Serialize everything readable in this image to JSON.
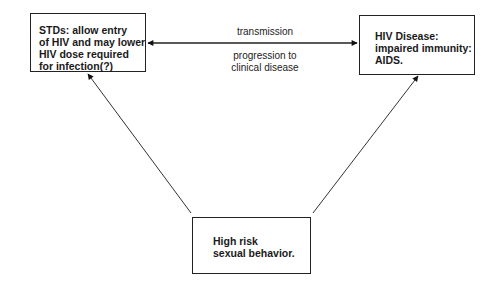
{
  "diagram": {
    "type": "flow-triangle",
    "nodes": {
      "stds": {
        "lines": [
          "STDs: allow entry",
          "of HIV and may lower",
          "HIV dose required",
          "for infection(?)"
        ]
      },
      "hiv_disease": {
        "lines": [
          "HIV Disease:",
          "impaired immunity:",
          "AIDS."
        ]
      },
      "high_risk": {
        "lines": [
          "High risk",
          "sexual behavior."
        ]
      }
    },
    "edges": {
      "horizontal": {
        "from": "stds",
        "to": "hiv_disease",
        "bidirectional": true,
        "label_top": "transmission",
        "label_bottom_lines": [
          "progression to",
          "clinical disease"
        ]
      },
      "left_diagonal": {
        "from": "high_risk",
        "to": "stds"
      },
      "right_diagonal": {
        "from": "high_risk",
        "to": "hiv_disease"
      }
    },
    "colors": {
      "line": "#222222",
      "background": "#ffffff",
      "text": "#1a1a1a"
    }
  }
}
